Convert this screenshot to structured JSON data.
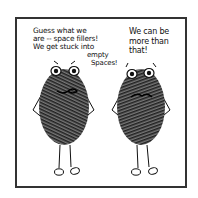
{
  "comic": {
    "left_character": {
      "speech_lines": [
        "Guess what we",
        "are -- space fillers!",
        "We get stuck into"
      ],
      "speech_tail": [
        "empty",
        "Spaces!"
      ],
      "description": "fingerprint blob character with hands on hips"
    },
    "right_character": {
      "speech_lines": [
        "We can be",
        "more than",
        "that!"
      ],
      "description": "fingerprint blob character with hands on hips, frowning"
    },
    "colors": {
      "ink": "#111111",
      "frame": "#333333",
      "background": "#ffffff"
    }
  }
}
